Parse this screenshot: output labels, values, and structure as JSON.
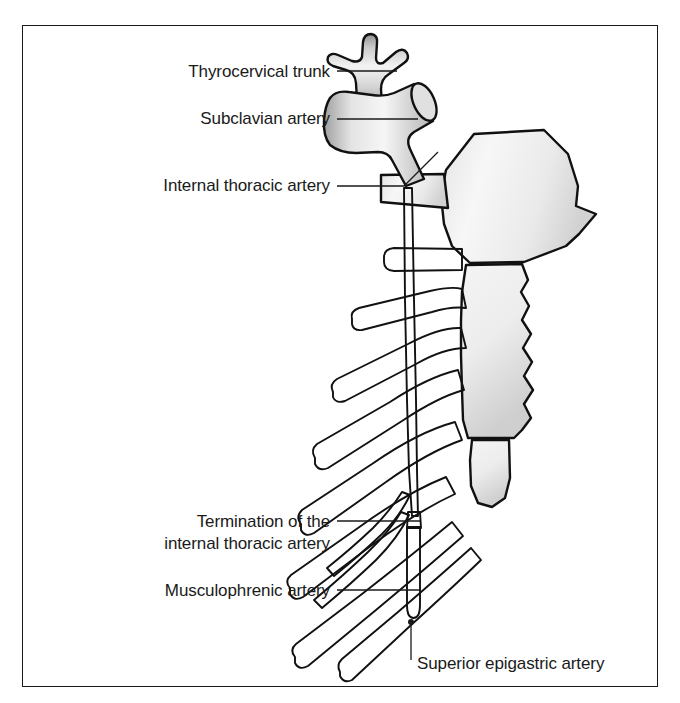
{
  "figure": {
    "kind": "anatomical-line-diagram",
    "background_color": "#ffffff",
    "frame_color": "#1a1a1a",
    "outline_color": "#111111",
    "fill_light": "#f2f2f2",
    "fill_mid": "#d8d8d8",
    "fill_dark": "#9a9a9a"
  },
  "labels": [
    {
      "id": "thyrocervical-trunk",
      "text": "Thyrocervical trunk",
      "lines": [
        "Thyrocervical trunk"
      ],
      "align": "right",
      "text_x": 330,
      "text_y": 77,
      "leader": "M 337 71 L 397 71"
    },
    {
      "id": "subclavian-artery",
      "text": "Subclavian artery",
      "lines": [
        "Subclavian artery"
      ],
      "align": "right",
      "text_x": 330,
      "text_y": 124,
      "leader": "M 337 119 L 330 119 L 330 119 L 337 119 L 337 119 L 337 119 L 337 119 M 337 119 L 332 119 M 337 119 L 415 119"
    },
    {
      "id": "internal-thoracic-artery",
      "text": "Internal thoracic artery",
      "lines": [
        "Internal thoracic artery"
      ],
      "align": "right",
      "text_x": 330,
      "text_y": 190,
      "leader": "M 337 186 L 404 186 L 438 152"
    },
    {
      "id": "termination-internal-thoracic",
      "text": "Termination of the internal thoracic artery",
      "lines": [
        "Termination of the",
        "internal thoracic artery"
      ],
      "align": "right",
      "text_x": 330,
      "text_y": 527,
      "leader": "M 337 521 L 420 521"
    },
    {
      "id": "musculophrenic-artery",
      "text": "Musculophrenic artery",
      "lines": [
        "Musculophrenic artery"
      ],
      "align": "right",
      "text_x": 330,
      "text_y": 595,
      "leader": "M 337 590 L 420 590"
    },
    {
      "id": "superior-epigastric-artery",
      "text": "Superior epigastric artery",
      "lines": [
        "Superior epigastric artery"
      ],
      "align": "left",
      "text_x": 417,
      "text_y": 668,
      "leader": "M 411 661 L 411 625"
    }
  ],
  "structures": [
    {
      "id": "thyrocervical-trunk-body",
      "name": "Thyrocervical trunk",
      "note": "trident-shaped branching stub on top of the subclavian artery"
    },
    {
      "id": "subclavian-artery-body",
      "name": "Subclavian artery",
      "note": "horizontal cylindrical vessel with open cut end at upper right"
    },
    {
      "id": "clavicle",
      "name": "Clavicle",
      "note": "trapezoidal block crossed by the internal thoracic artery"
    },
    {
      "id": "manubrium",
      "name": "Manubrium of sternum",
      "note": "hexagonal upper sternum segment"
    },
    {
      "id": "sternum-body",
      "name": "Body of sternum",
      "note": "elongated segment with scalloped lateral border"
    },
    {
      "id": "xiphoid-process",
      "name": "Xiphoid process",
      "note": "small rounded tapering tip below the sternal body"
    },
    {
      "id": "costal-cartilages",
      "name": "Costal cartilages",
      "note": "series of rounded bars angling inferolaterally from the sternum"
    },
    {
      "id": "internal-thoracic-artery-trunk",
      "name": "Internal thoracic artery",
      "note": "long thin vessel descending just lateral to the sternal border"
    },
    {
      "id": "musculophrenic-branch",
      "name": "Musculophrenic artery",
      "note": "inferolateral terminal branch following the costal margin"
    },
    {
      "id": "superior-epigastric-branch",
      "name": "Superior epigastric artery",
      "note": "vertical terminal branch continuing inferiorly"
    }
  ]
}
